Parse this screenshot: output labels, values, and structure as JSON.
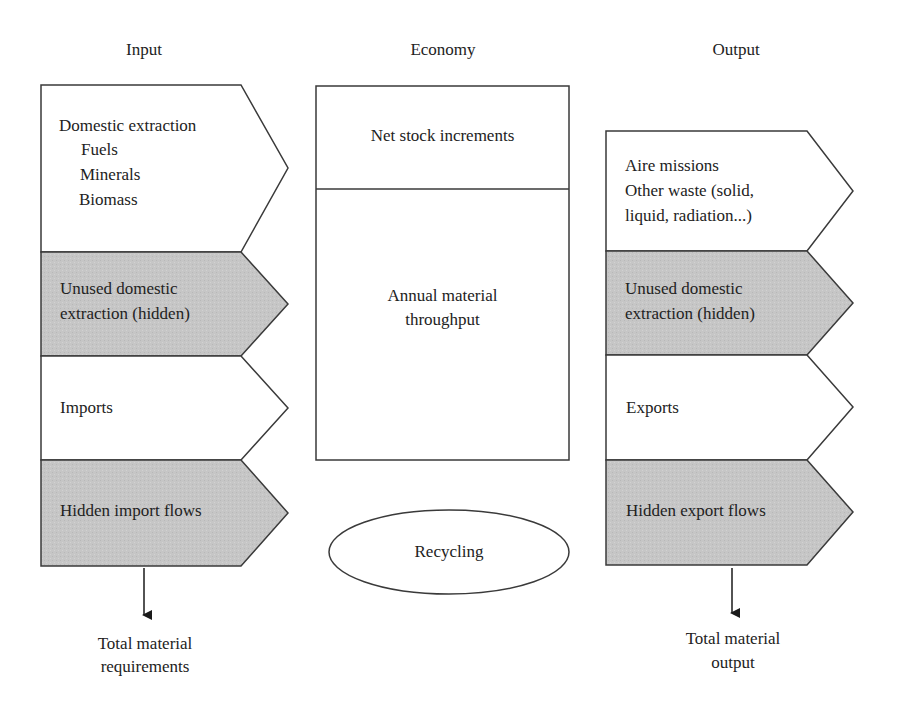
{
  "headers": {
    "input": "Input",
    "economy": "Economy",
    "output": "Output"
  },
  "input_column": {
    "blocks": [
      {
        "lines": [
          "Domestic extraction",
          "Fuels",
          "Minerals",
          "Biomass"
        ],
        "shaded": false
      },
      {
        "lines": [
          "Unused domestic",
          "extraction (hidden)"
        ],
        "shaded": true
      },
      {
        "lines": [
          "Imports"
        ],
        "shaded": false
      },
      {
        "lines": [
          "Hidden import flows"
        ],
        "shaded": true
      }
    ],
    "total_label": [
      "Total material",
      "requirements"
    ]
  },
  "economy_column": {
    "top_box": "Net stock increments",
    "main_box": [
      "Annual material",
      "throughput"
    ],
    "recycling": "Recycling"
  },
  "output_column": {
    "blocks": [
      {
        "lines": [
          "Aire missions",
          "Other waste (solid,",
          "liquid, radiation...)"
        ],
        "shaded": false
      },
      {
        "lines": [
          "Unused domestic",
          "extraction (hidden)"
        ],
        "shaded": true
      },
      {
        "lines": [
          "Exports"
        ],
        "shaded": false
      },
      {
        "lines": [
          "Hidden export flows"
        ],
        "shaded": true
      }
    ],
    "total_label": [
      "Total material",
      "output"
    ]
  },
  "colors": {
    "stroke": "#3a3a3a",
    "shaded_fill": "#c8c8c8",
    "unshaded_fill": "#ffffff",
    "text": "#222222"
  }
}
